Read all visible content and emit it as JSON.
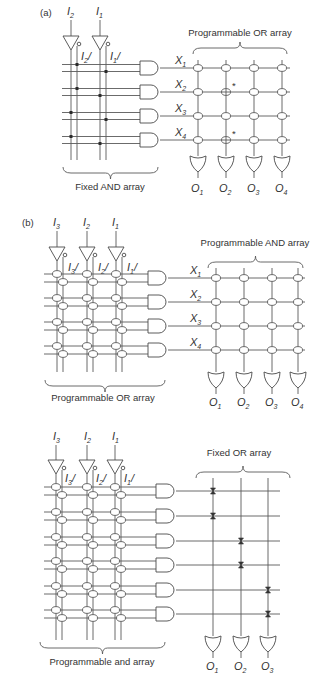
{
  "figure": {
    "panels": [
      {
        "id": "a",
        "tag": "(a)",
        "inputs": [
          {
            "name": "I",
            "sub": "2",
            "inv": "/"
          },
          {
            "name": "I",
            "sub": "1",
            "inv": "/"
          }
        ],
        "left_label": "Fixed AND array",
        "right_label": "Programmable OR array",
        "products": [
          {
            "name": "X",
            "sub": "1"
          },
          {
            "name": "X",
            "sub": "2"
          },
          {
            "name": "X",
            "sub": "3"
          },
          {
            "name": "X",
            "sub": "4"
          }
        ],
        "outputs": [
          {
            "name": "O",
            "sub": "1"
          },
          {
            "name": "O",
            "sub": "2"
          },
          {
            "name": "O",
            "sub": "3"
          },
          {
            "name": "O",
            "sub": "4"
          }
        ],
        "and_connections": [
          [
            1,
            3
          ],
          [
            1,
            2
          ],
          [
            0,
            3
          ],
          [
            0,
            2
          ]
        ],
        "blown_fuses": [
          [
            1,
            1
          ],
          [
            3,
            1
          ]
        ],
        "fuse_marker": "*"
      },
      {
        "id": "b",
        "tag": "(b)",
        "inputs": [
          {
            "name": "I",
            "sub": "3",
            "inv": "/"
          },
          {
            "name": "I",
            "sub": "2",
            "inv": "/"
          },
          {
            "name": "I",
            "sub": "1",
            "inv": "/"
          }
        ],
        "left_label": "Programmable OR array",
        "right_label": "Programmable AND array",
        "products": [
          {
            "name": "X",
            "sub": "1"
          },
          {
            "name": "X",
            "sub": "2"
          },
          {
            "name": "X",
            "sub": "3"
          },
          {
            "name": "X",
            "sub": "4"
          }
        ],
        "outputs": [
          {
            "name": "O",
            "sub": "1"
          },
          {
            "name": "O",
            "sub": "2"
          },
          {
            "name": "O",
            "sub": "3"
          },
          {
            "name": "O",
            "sub": "4"
          }
        ]
      },
      {
        "id": "c",
        "tag": "",
        "inputs": [
          {
            "name": "I",
            "sub": "3",
            "inv": "/"
          },
          {
            "name": "I",
            "sub": "2",
            "inv": "/"
          },
          {
            "name": "I",
            "sub": "1",
            "inv": "/"
          }
        ],
        "left_label": "Programmable and array",
        "right_label": "Fixed OR array",
        "product_count": 6,
        "outputs": [
          {
            "name": "O",
            "sub": "1"
          },
          {
            "name": "O",
            "sub": "2"
          },
          {
            "name": "O",
            "sub": "3"
          }
        ],
        "or_connections": [
          [
            0,
            0
          ],
          [
            1,
            0
          ],
          [
            2,
            1
          ],
          [
            3,
            1
          ],
          [
            4,
            2
          ],
          [
            5,
            2
          ]
        ]
      }
    ]
  }
}
